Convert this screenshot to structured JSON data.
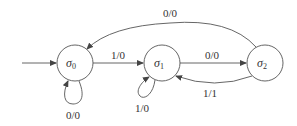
{
  "diagram": {
    "type": "finite-state-machine",
    "states": [
      {
        "id": "s0",
        "symbol": "σ",
        "subscript": "0",
        "initial": true
      },
      {
        "id": "s1",
        "symbol": "σ",
        "subscript": "1",
        "initial": false
      },
      {
        "id": "s2",
        "symbol": "σ",
        "subscript": "2",
        "initial": false
      }
    ],
    "transitions": [
      {
        "from": "s0",
        "to": "s0",
        "label": "0/0"
      },
      {
        "from": "s0",
        "to": "s1",
        "label": "1/0"
      },
      {
        "from": "s1",
        "to": "s1",
        "label": "1/0"
      },
      {
        "from": "s1",
        "to": "s2",
        "label": "0/0"
      },
      {
        "from": "s2",
        "to": "s1",
        "label": "1/1"
      },
      {
        "from": "s2",
        "to": "s0",
        "label": "0/0"
      }
    ]
  }
}
